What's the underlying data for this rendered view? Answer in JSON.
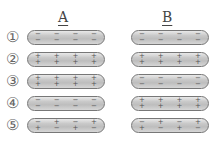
{
  "columns": [
    {
      "label": "A"
    },
    {
      "label": "B"
    }
  ],
  "rows": [
    {
      "label": "①"
    },
    {
      "label": "②"
    },
    {
      "label": "③"
    },
    {
      "label": "④"
    },
    {
      "label": "⑤"
    }
  ],
  "rods": {
    "A": [
      {
        "top": [
          "−",
          "−",
          "−",
          "−"
        ],
        "bottom": [
          "−",
          "−",
          "−",
          "−"
        ]
      },
      {
        "top": [
          "+",
          "+",
          "+",
          "+"
        ],
        "bottom": [
          "+",
          "+",
          "+",
          "+"
        ]
      },
      {
        "top": [
          "+",
          "+",
          "+",
          "+"
        ],
        "bottom": [
          "+",
          "+",
          "+",
          "+"
        ]
      },
      {
        "top": [
          "−",
          "−",
          "−",
          "−"
        ],
        "bottom": [
          "−",
          "−",
          "−",
          "−"
        ]
      },
      {
        "top": [
          "−",
          "+",
          "−",
          "+"
        ],
        "bottom": [
          "+",
          "−",
          "+",
          "−"
        ]
      }
    ],
    "B": [
      {
        "top": [
          "−",
          "−",
          "−",
          "−"
        ],
        "bottom": [
          "−",
          "−",
          "−",
          "−"
        ]
      },
      {
        "top": [
          "+",
          "+",
          "+",
          "+"
        ],
        "bottom": [
          "+",
          "+",
          "+",
          "+"
        ]
      },
      {
        "top": [
          "−",
          "−",
          "−",
          "−"
        ],
        "bottom": [
          "−",
          "−",
          "−",
          "−"
        ]
      },
      {
        "top": [
          "+",
          "+",
          "+",
          "+"
        ],
        "bottom": [
          "+",
          "+",
          "+",
          "+"
        ]
      },
      {
        "top": [
          "−",
          "+",
          "−",
          "+"
        ],
        "bottom": [
          "+",
          "−",
          "+",
          "−"
        ]
      }
    ]
  },
  "colors": {
    "rod_border": "#777777",
    "rod_fill": "#c9c9c9",
    "text": "#444444"
  }
}
